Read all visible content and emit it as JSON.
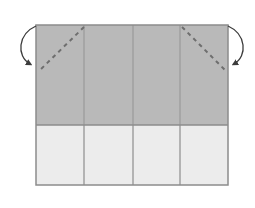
{
  "diagram": {
    "type": "origami-fold-step",
    "colors": {
      "background": "#ffffff",
      "paper_colored_side": "#b9b9b9",
      "paper_white_side": "#ececec",
      "edge": "#8c8c8c",
      "crease": "#a8a8a8",
      "fold_line": "#6e6e6e",
      "arrow": "#3c3c3c"
    },
    "sheet": {
      "x": 36,
      "y": 25,
      "width": 192,
      "height": 160
    },
    "colored_region": {
      "y_top": 25,
      "y_bottom": 125
    },
    "vertical_creases_x": [
      84,
      133,
      180
    ],
    "fold_lines": [
      {
        "name": "left-diagonal-fold",
        "x1": 84,
        "y1": 27,
        "x2": 39,
        "y2": 71
      },
      {
        "name": "right-diagonal-fold",
        "x1": 182,
        "y1": 27,
        "x2": 225,
        "y2": 70
      }
    ],
    "arrows": [
      {
        "name": "left-fold-arrow",
        "direction": "fold-down-left"
      },
      {
        "name": "right-fold-arrow",
        "direction": "fold-down-right"
      }
    ]
  }
}
